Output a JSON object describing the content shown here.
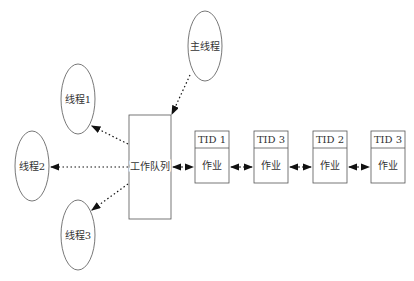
{
  "nodes": {
    "main_thread": "主线程",
    "thread1": "线程1",
    "thread2": "线程2",
    "thread3": "线程3",
    "work_queue": "工作队列"
  },
  "jobs": [
    {
      "tid": "TID 1",
      "label": "作业"
    },
    {
      "tid": "TID 3",
      "label": "作业"
    },
    {
      "tid": "TID 2",
      "label": "作业"
    },
    {
      "tid": "TID 3",
      "label": "作业"
    }
  ]
}
